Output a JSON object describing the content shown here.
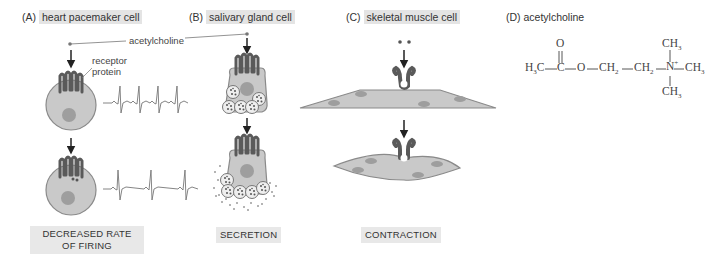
{
  "panels": [
    {
      "letter": "(A)",
      "title": "heart pacemaker cell",
      "outcome_line1": "DECREASED RATE",
      "outcome_line2": "OF FIRING"
    },
    {
      "letter": "(B)",
      "title": "salivary gland cell",
      "outcome_line1": "SECRETION"
    },
    {
      "letter": "(C)",
      "title": "skeletal muscle cell",
      "outcome_line1": "CONTRACTION"
    },
    {
      "letter": "(D)",
      "title": "acetylcholine"
    }
  ],
  "annotations": {
    "ligand": "acetylcholine",
    "receptor_line1": "receptor",
    "receptor_line2": "protein"
  },
  "structure": {
    "left_group": "H3C",
    "carbonyl_o": "O",
    "ester_o": "O",
    "ch2": "CH2",
    "n_plus": "N+",
    "methyl": "CH3"
  },
  "colors": {
    "cell_fill": "#c9c9c9",
    "cell_stroke": "#8a8a8a",
    "nucleus": "#9e9e9e",
    "receptor": "#5a5a5a",
    "label_bg": "#e4e4e4"
  }
}
